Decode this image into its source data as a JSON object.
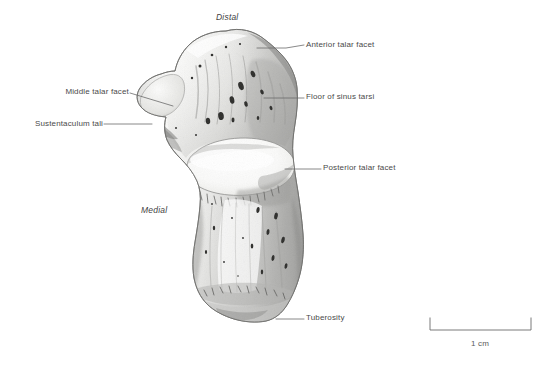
{
  "figure": {
    "background_color": "#ffffff",
    "line_color": "#6b6b6b",
    "text_color": "#4a4a4a"
  },
  "orientation_labels": [
    {
      "name": "distal",
      "text": "Distal",
      "x": 216,
      "y": 13
    },
    {
      "name": "medial",
      "text": "Medial",
      "x": 141,
      "y": 206
    }
  ],
  "annotations": [
    {
      "name": "anterior-talar-facet",
      "text": "Anterior talar facet",
      "side": "right",
      "text_x": 306,
      "text_y": 41,
      "leader": "M 257 48 L 286 48 L 304 45"
    },
    {
      "name": "floor-of-sinus-tarsi",
      "text": "Floor of sinus tarsi",
      "side": "right",
      "text_x": 306,
      "text_y": 93,
      "leader": "M 264 98 L 304 98"
    },
    {
      "name": "posterior-talar-facet",
      "text": "Posterior talar facet",
      "side": "right",
      "text_x": 323,
      "text_y": 164,
      "leader": "M 285 169 L 321 169"
    },
    {
      "name": "tuberosity",
      "text": "Tuberosity",
      "side": "right",
      "text_x": 306,
      "text_y": 314,
      "leader": "M 276 319 L 304 319"
    },
    {
      "name": "middle-talar-facet",
      "text": "Middle talar facet",
      "side": "left",
      "text_x": 44,
      "text_y": 88,
      "leader": "M 130 93 L 173 106"
    },
    {
      "name": "sustentaculum-tali",
      "text": "Sustentaculum tali",
      "side": "left",
      "text_x": 18,
      "text_y": 120,
      "leader": "M 104 124 L 152 124"
    }
  ],
  "scale_bar": {
    "name": "scale-bar",
    "label": "1 cm",
    "x1": 430,
    "x2": 531,
    "y": 330,
    "cap_height": 12,
    "label_x": 480,
    "label_y": 340
  }
}
